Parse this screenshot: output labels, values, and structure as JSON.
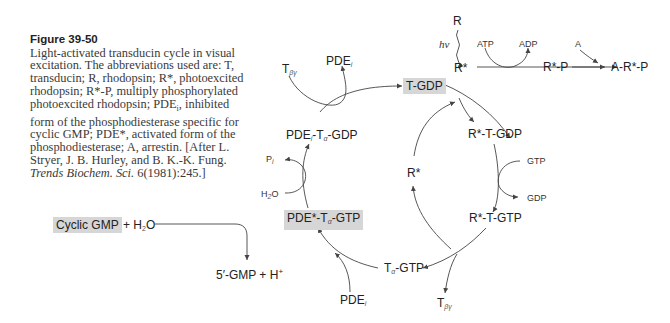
{
  "caption": {
    "figure_label": "Figure 39-50",
    "text_main": "Light-activated transducin cycle in visual excitation. The abbreviations used are: T, transducin; R, rhodopsin; R*, photoexcited rhodopsin; R*-P, multiply phosphorylated photoexcited rhodopsin; PDE",
    "text_sub_i": "i",
    "text_cont": ", inhibited form of the phosphodiesterase specific for cyclic GMP; PDE*, activated form of the phosphodiesterase; A, arrestin. [After L. Stryer, J. B. Hurley, and B. K.-K. Fung. ",
    "journal": "Trends Biochem. Sci.",
    "citation_end": " 6(1981):245.]"
  },
  "diagram": {
    "cycle_nodes": {
      "t_gdp": "T-GDP",
      "rstar_t_gdp": "R*-T-GDP",
      "rstar_t_gtp": "R*-T-GTP",
      "talpha_gtp_main": "T",
      "talpha_gtp_sub": "α",
      "talpha_gtp_end": "-GTP",
      "pdestar_talpha_gtp_main": "PDE*-T",
      "pdestar_talpha_gtp_sub": "α",
      "pdestar_talpha_gtp_end": "-GTP",
      "pdei_talpha_gdp_main": "PDE",
      "pdei_talpha_gdp_sub1": "i",
      "pdei_talpha_gdp_mid": "-T",
      "pdei_talpha_gdp_sub2": "α",
      "pdei_talpha_gdp_end": "-GDP",
      "rstar_center": "R*"
    },
    "side_labels": {
      "r": "R",
      "hv": "hν",
      "rstar_top": "R*",
      "atp": "ATP",
      "adp": "ADP",
      "rstar_p": "R*-P",
      "a": "A",
      "a_rstar_p": "A-R*-P",
      "gtp": "GTP",
      "gdp": "GDP",
      "tbg_bottom_main": "T",
      "tbg_bottom_sub": "βγ",
      "tbg_top_main": "T",
      "tbg_top_sub": "βγ",
      "pdei_top_main": "PDE",
      "pdei_top_sub": "i",
      "pdei_bottom_main": "PDE",
      "pdei_bottom_sub": "i",
      "pi_main": "P",
      "pi_sub": "i",
      "h2o_main": "H",
      "h2o_sub": "2",
      "h2o_end": "O"
    },
    "reaction": {
      "cyclic_gmp": "Cyclic GMP",
      "plus_water_a": "+ H",
      "plus_water_sub": "2",
      "plus_water_b": "O",
      "product_a": "5′-GMP + H",
      "product_sup": "+"
    },
    "colors": {
      "highlight_box": "#d6d6d6",
      "line": "#444444",
      "text": "#222222"
    }
  }
}
